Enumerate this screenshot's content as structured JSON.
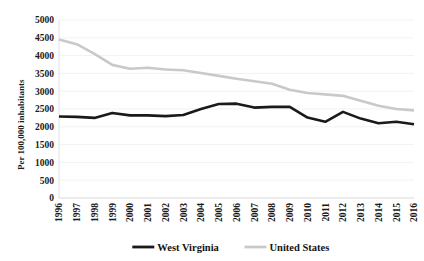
{
  "figure": {
    "title_remnant": "Drug Overdose",
    "background_color": "#ffffff"
  },
  "chart_data": {
    "type": "line",
    "title": "",
    "xlabel": "",
    "ylabel": "Per 100,000 inhabitants",
    "x": [
      1996,
      1997,
      1998,
      1999,
      2000,
      2001,
      2002,
      2003,
      2004,
      2005,
      2006,
      2007,
      2008,
      2009,
      2010,
      2011,
      2012,
      2013,
      2014,
      2015,
      2016
    ],
    "xtick_labels": [
      "1996",
      "1997",
      "1998",
      "1999",
      "2000",
      "2001",
      "2002",
      "2003",
      "2004",
      "2005",
      "2006",
      "2007",
      "2008",
      "2009",
      "2010",
      "2011",
      "2012",
      "2013",
      "2014",
      "2015",
      "2016"
    ],
    "ylim": [
      0,
      5000
    ],
    "ytick_labels": [
      "0",
      "500",
      "1000",
      "1500",
      "2000",
      "2500",
      "3000",
      "3500",
      "4000",
      "4500",
      "5000"
    ],
    "ytick_values": [
      0,
      500,
      1000,
      1500,
      2000,
      2500,
      3000,
      3500,
      4000,
      4500,
      5000
    ],
    "grid": false,
    "legend_position": "bottom",
    "series": [
      {
        "name": "West Virginia",
        "color": "#1a1a1a",
        "stroke_width": 2.6,
        "values": [
          2290,
          2280,
          2250,
          2390,
          2320,
          2320,
          2300,
          2330,
          2500,
          2640,
          2650,
          2540,
          2560,
          2560,
          2260,
          2140,
          2420,
          2230,
          2100,
          2140,
          2070
        ]
      },
      {
        "name": "United States",
        "color": "#c9c9c9",
        "stroke_width": 2.6,
        "values": [
          4450,
          4320,
          4050,
          3740,
          3630,
          3660,
          3610,
          3590,
          3510,
          3430,
          3350,
          3280,
          3210,
          3040,
          2950,
          2910,
          2870,
          2730,
          2590,
          2500,
          2460
        ]
      }
    ]
  },
  "legend": {
    "items": [
      {
        "label": "West Virginia",
        "color": "#1a1a1a"
      },
      {
        "label": "United States",
        "color": "#c9c9c9"
      }
    ]
  }
}
